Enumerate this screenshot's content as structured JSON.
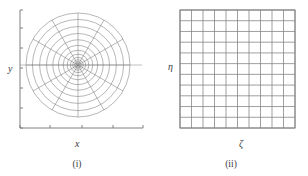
{
  "figure": {
    "type": "two-panel-mesh-diagram",
    "line_color": "#808080",
    "axis_color": "#808080",
    "text_color": "#3b3b3b",
    "background_color": "#ffffff"
  },
  "panels": [
    {
      "id": "physical",
      "caption": "(i)",
      "x_axis_label": "x",
      "y_axis_label": "y",
      "mesh": {
        "kind": "polar",
        "center_x": 78,
        "center_y": 65,
        "outer_radius": 52,
        "radial_rings": 12,
        "angular_spokes": 12,
        "ring_radii": [
          2.1,
          3.4,
          5.2,
          7.6,
          10.8,
          14.8,
          19.6,
          25.2,
          31.5,
          38.4,
          45.6,
          52.0
        ],
        "spoke_angles_deg": [
          0,
          30,
          60,
          90,
          120,
          150,
          180,
          210,
          240,
          270,
          300,
          330
        ]
      },
      "axes": {
        "origin_x": 20,
        "origin_y": 128,
        "x_axis_end": 143,
        "y_axis_top": 10,
        "x_tick_positions": [
          20,
          50,
          82,
          113,
          143
        ],
        "y_tick_positions": [
          128,
          108,
          88,
          68,
          48,
          28,
          10
        ]
      }
    },
    {
      "id": "computational",
      "caption": "(ii)",
      "x_axis_label": "ζ",
      "y_axis_label": "η",
      "mesh": {
        "kind": "rectangular",
        "left": 26,
        "top": 10,
        "right": 141,
        "bottom": 128,
        "columns": 10,
        "rows": 11
      }
    }
  ],
  "chart_data": {
    "type": "line",
    "title": "",
    "xlabel": "",
    "ylabel": "",
    "panels": [
      {
        "name": "(i) physical space",
        "xlabel": "x",
        "ylabel": "y",
        "grid_type": "polar",
        "rings": 12,
        "spokes": 12
      },
      {
        "name": "(ii) computational space",
        "xlabel": "ζ",
        "ylabel": "η",
        "grid_type": "uniform-rectangular",
        "columns": 10,
        "rows": 11
      }
    ]
  }
}
